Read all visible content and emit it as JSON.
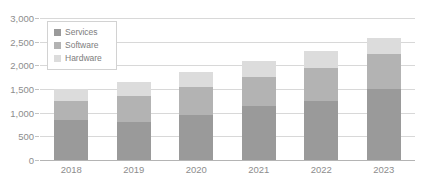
{
  "chart_data": {
    "type": "bar",
    "subtype": "stacked-bar",
    "title": "",
    "xlabel": "",
    "ylabel": "",
    "categories": [
      "2018",
      "2019",
      "2020",
      "2021",
      "2022",
      "2023"
    ],
    "series": [
      {
        "name": "Services",
        "color": "#9a9a9a",
        "values": [
          850,
          800,
          950,
          1150,
          1250,
          1500
        ]
      },
      {
        "name": "Software",
        "color": "#b3b3b3",
        "values": [
          400,
          550,
          600,
          600,
          700,
          750
        ]
      },
      {
        "name": "Hardware",
        "color": "#dcdcdc",
        "values": [
          250,
          300,
          320,
          350,
          350,
          330
        ]
      }
    ],
    "totals": [
      1500,
      1650,
      1870,
      2100,
      2300,
      2580
    ],
    "ylim": [
      0,
      3000
    ],
    "ytick_values": [
      0,
      500,
      1000,
      1500,
      2000,
      2500,
      3000
    ],
    "ytick_labels": [
      "0",
      "500",
      "1,000",
      "1,500",
      "2,000",
      "2,500",
      "3,000"
    ],
    "grid": true,
    "grid_axis": "y",
    "legend_position": "top-left-inside",
    "stack_order_bottom_to_top": [
      "Services",
      "Software",
      "Hardware"
    ]
  },
  "legend": {
    "items": [
      {
        "label": "Services",
        "color": "#9a9a9a"
      },
      {
        "label": "Software",
        "color": "#b3b3b3"
      },
      {
        "label": "Hardware",
        "color": "#dcdcdc"
      }
    ]
  },
  "axis": {
    "y_labels": [
      "3,000",
      "2,500",
      "2,000",
      "1,500",
      "1,000",
      "500",
      "0"
    ],
    "x_labels": [
      "2018",
      "2019",
      "2020",
      "2021",
      "2022",
      "2023"
    ]
  },
  "colors": {
    "gridline": "#d8d8d8",
    "baseline": "#b4b4b4",
    "tick": "#c2c2c2",
    "axis_text": "#8d8d8d",
    "legend_text": "#7d7d7d",
    "legend_border": "#d2d2d2",
    "background": "#ffffff"
  }
}
